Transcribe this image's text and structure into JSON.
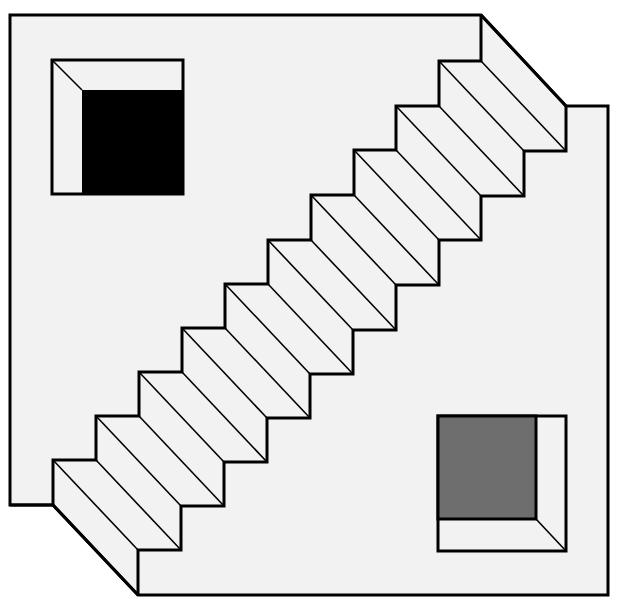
{
  "figure": {
    "colors": {
      "background": "#ffffff",
      "surface": "#f2f2f2",
      "stroke": "#000000",
      "dark_square": "#000000",
      "gray_square": "#6e6e6e"
    },
    "stairs": {
      "step_count": 10,
      "step_dx": 43,
      "step_dy": 44.5,
      "depth_offset": [
        85,
        90
      ]
    },
    "squares": [
      {
        "name": "top-left-recess",
        "fill": "dark"
      },
      {
        "name": "bottom-right-recess",
        "fill": "gray"
      }
    ]
  }
}
